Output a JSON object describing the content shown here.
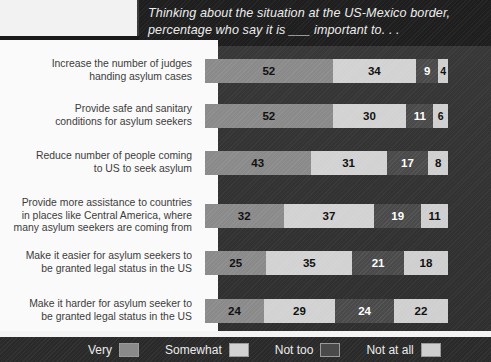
{
  "title": "Thinking about the situation at the US-Mexico border, percentage who say it is ___ important to. . .",
  "legend": {
    "items": [
      {
        "label": "Very",
        "color": "#8a8a8a"
      },
      {
        "label": "Somewhat",
        "color": "#d2d2d2"
      },
      {
        "label": "Not too",
        "color": "#4a4a4a"
      },
      {
        "label": "Not at all",
        "color": "#cfcfcf"
      }
    ]
  },
  "chart_data": {
    "type": "bar",
    "title": "Thinking about the situation at the US-Mexico border, percentage who say it is ___ important to. . .",
    "xlabel": "",
    "ylabel": "",
    "xlim": [
      0,
      100
    ],
    "grid": false,
    "stacked": true,
    "orientation": "horizontal",
    "legend_position": "bottom",
    "categories": [
      "Increase the number of judges\nhanding asylum cases",
      "Provide safe and sanitary\nconditions for asylum seekers",
      "Reduce number of people coming\nto US to seek asylum",
      "Provide more assistance to countries\nin places like Central America, where\nmany asylum seekers are coming from",
      "Make it easier for asylum seekers to\nbe granted legal status in the US",
      "Make it harder for asylum seeker to\nbe granted legal status in the US"
    ],
    "series": [
      {
        "name": "Very",
        "values": [
          52,
          52,
          43,
          32,
          25,
          24
        ]
      },
      {
        "name": "Somewhat",
        "values": [
          34,
          30,
          31,
          37,
          35,
          29
        ]
      },
      {
        "name": "Not too",
        "values": [
          9,
          11,
          17,
          19,
          21,
          24
        ]
      },
      {
        "name": "Not at all",
        "values": [
          4,
          6,
          8,
          11,
          18,
          22
        ]
      }
    ],
    "rows": [
      {
        "label": "Increase the number of judges\nhanding asylum cases",
        "values": [
          52,
          34,
          9,
          4
        ]
      },
      {
        "label": "Provide safe and sanitary\nconditions for asylum seekers",
        "values": [
          52,
          30,
          11,
          6
        ]
      },
      {
        "label": "Reduce number of people coming\nto US to seek asylum",
        "values": [
          43,
          31,
          17,
          8
        ]
      },
      {
        "label": "Provide more assistance to countries\nin places like Central America, where\nmany asylum seekers are coming from",
        "values": [
          32,
          37,
          19,
          11
        ]
      },
      {
        "label": "Make it easier for asylum seekers to\nbe granted legal status in the US",
        "values": [
          25,
          35,
          21,
          18
        ]
      },
      {
        "label": "Make it harder for asylum seeker to\nbe granted legal status in the US",
        "values": [
          24,
          29,
          24,
          22
        ]
      }
    ]
  }
}
